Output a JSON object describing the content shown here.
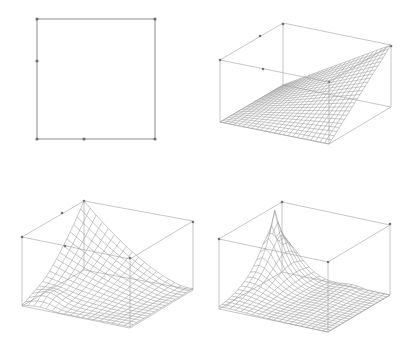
{
  "figure": {
    "line_color": "#9a9a9a",
    "box_color": "#b8b8b8",
    "background": "#ffffff"
  },
  "panels": [
    {
      "id": "domain-square",
      "type": "2d-domain",
      "corners": [
        [
          37,
          19
        ],
        [
          155,
          19
        ],
        [
          155,
          139
        ],
        [
          37,
          139
        ]
      ],
      "points": [
        [
          37,
          19
        ],
        [
          155,
          19
        ],
        [
          37,
          61
        ],
        [
          37,
          139
        ],
        [
          84,
          139
        ],
        [
          155,
          139
        ]
      ]
    },
    {
      "id": "surface-bilinear",
      "type": "3d-wireframe",
      "base": {
        "L": [
          220,
          122
        ],
        "F": [
          329,
          144
        ],
        "R": [
          391,
          107
        ],
        "B": [
          283,
          85
        ]
      },
      "height": 62,
      "grid": 24,
      "surface": "bilinear",
      "box_points": [
        [
          283,
          24
        ],
        [
          220,
          60
        ],
        [
          391,
          46
        ],
        [
          329,
          82
        ],
        [
          260,
          36
        ],
        [
          263,
          69
        ]
      ]
    },
    {
      "id": "surface-ridge",
      "type": "3d-wireframe",
      "base": {
        "L": [
          22,
          306
        ],
        "F": [
          130,
          328
        ],
        "R": [
          193,
          290
        ],
        "B": [
          84,
          270
        ]
      },
      "height": 69,
      "grid": 18,
      "surface": "back-peak",
      "box_points": [
        [
          84,
          201
        ],
        [
          22,
          237
        ],
        [
          193,
          222
        ],
        [
          130,
          258
        ],
        [
          62,
          213
        ],
        [
          65,
          246
        ]
      ]
    },
    {
      "id": "surface-spike",
      "type": "3d-wireframe",
      "base": {
        "L": [
          219,
          309
        ],
        "F": [
          328,
          332
        ],
        "R": [
          390,
          295
        ],
        "B": [
          282,
          272
        ]
      },
      "height": 70,
      "grid": 20,
      "surface": "sharp-peak",
      "box_points": [
        [
          282,
          202
        ],
        [
          219,
          239
        ],
        [
          390,
          224
        ],
        [
          328,
          262
        ]
      ]
    }
  ]
}
